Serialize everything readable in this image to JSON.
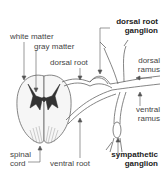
{
  "diagram": {
    "labels": {
      "dorsal_root_ganglion_1": "dorsal root",
      "dorsal_root_ganglion_2": "ganglion",
      "white_matter": "white matter",
      "gray_matter": "gray matter",
      "dorsal_root": "dorsal root",
      "dorsal_ramus_1": "dorsal",
      "dorsal_ramus_2": "ramus",
      "ventral_ramus_1": "ventral",
      "ventral_ramus_2": "ramus",
      "spinal_cord_1": "spinal",
      "spinal_cord_2": "cord",
      "ventral_root": "ventral root",
      "sympathetic_ganglion_1": "sympathetic",
      "sympathetic_ganglion_2": "ganglion"
    },
    "colors": {
      "line": "#555555",
      "text": "#444444",
      "bold_text": "#222222"
    }
  }
}
